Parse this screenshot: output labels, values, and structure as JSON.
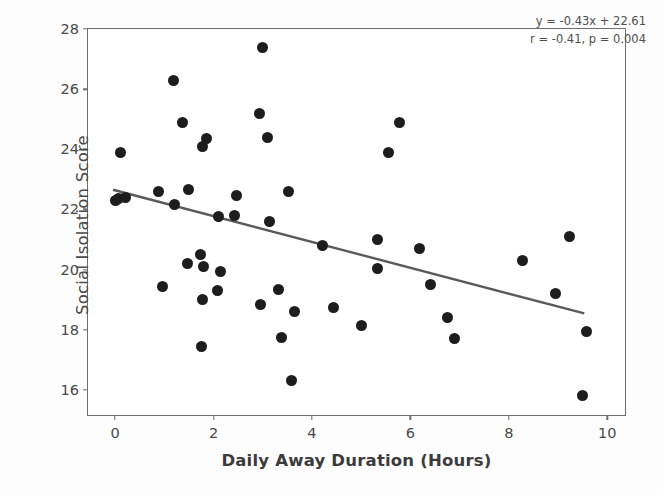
{
  "chart_data": {
    "type": "scatter",
    "title": "",
    "xlabel": "Daily Away Duration (Hours)",
    "ylabel": "Social Isolation Score",
    "xlim": [
      -0.55,
      10.4
    ],
    "ylim": [
      15.1,
      28.0
    ],
    "xticks": [
      0,
      2,
      4,
      6,
      8,
      10
    ],
    "yticks": [
      16,
      18,
      20,
      22,
      24,
      26,
      28
    ],
    "grid": false,
    "legend": null,
    "marker_color": "#1d1d1d",
    "line_color": "#5a5a5a",
    "points": [
      {
        "x": 0.0,
        "y": 22.3
      },
      {
        "x": 0.06,
        "y": 22.35
      },
      {
        "x": 0.12,
        "y": 23.9
      },
      {
        "x": 0.21,
        "y": 22.4
      },
      {
        "x": 0.89,
        "y": 22.6
      },
      {
        "x": 0.97,
        "y": 19.45
      },
      {
        "x": 1.18,
        "y": 26.3
      },
      {
        "x": 1.2,
        "y": 22.15
      },
      {
        "x": 1.36,
        "y": 24.9
      },
      {
        "x": 1.47,
        "y": 20.2
      },
      {
        "x": 1.5,
        "y": 22.65
      },
      {
        "x": 1.74,
        "y": 20.5
      },
      {
        "x": 1.76,
        "y": 17.45
      },
      {
        "x": 1.78,
        "y": 24.1
      },
      {
        "x": 1.78,
        "y": 19.0
      },
      {
        "x": 1.8,
        "y": 20.1
      },
      {
        "x": 1.86,
        "y": 24.35
      },
      {
        "x": 2.09,
        "y": 19.3
      },
      {
        "x": 2.11,
        "y": 21.75
      },
      {
        "x": 2.15,
        "y": 19.95
      },
      {
        "x": 2.42,
        "y": 21.8
      },
      {
        "x": 2.46,
        "y": 22.45
      },
      {
        "x": 2.93,
        "y": 25.2
      },
      {
        "x": 2.95,
        "y": 18.85
      },
      {
        "x": 3.0,
        "y": 27.4
      },
      {
        "x": 3.1,
        "y": 24.4
      },
      {
        "x": 3.14,
        "y": 21.6
      },
      {
        "x": 3.33,
        "y": 19.35
      },
      {
        "x": 3.39,
        "y": 17.75
      },
      {
        "x": 3.53,
        "y": 22.6
      },
      {
        "x": 3.58,
        "y": 16.3
      },
      {
        "x": 3.64,
        "y": 18.6
      },
      {
        "x": 4.22,
        "y": 20.8
      },
      {
        "x": 4.44,
        "y": 18.75
      },
      {
        "x": 5.0,
        "y": 18.15
      },
      {
        "x": 5.33,
        "y": 21.0
      },
      {
        "x": 5.33,
        "y": 20.05
      },
      {
        "x": 5.56,
        "y": 23.9
      },
      {
        "x": 5.77,
        "y": 24.9
      },
      {
        "x": 6.18,
        "y": 20.7
      },
      {
        "x": 6.4,
        "y": 19.5
      },
      {
        "x": 6.76,
        "y": 18.4
      },
      {
        "x": 6.9,
        "y": 17.7
      },
      {
        "x": 8.28,
        "y": 20.3
      },
      {
        "x": 8.95,
        "y": 19.2
      },
      {
        "x": 9.24,
        "y": 21.1
      },
      {
        "x": 9.5,
        "y": 15.8
      },
      {
        "x": 9.57,
        "y": 17.95
      }
    ],
    "fit_line": {
      "slope": -0.43,
      "intercept": 22.61,
      "x_start": -0.04,
      "x_end": 9.57
    },
    "annotations": [
      "y = -0.43x + 22.61",
      "r = -0.41, p = 0.004"
    ]
  }
}
